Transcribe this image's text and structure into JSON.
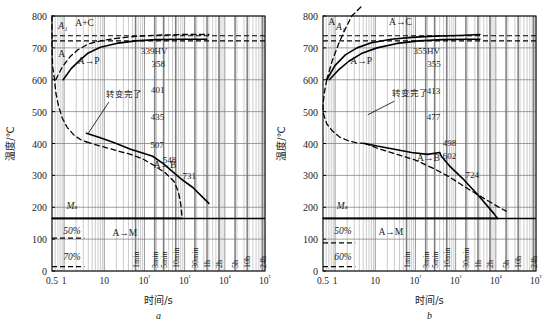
{
  "figure": {
    "title": "",
    "panels": [
      "a",
      "b"
    ]
  },
  "chart_data": [
    {
      "type": "line",
      "panel_label": "a",
      "title": "",
      "xlabel": "时间/s",
      "ylabel": "温度/℃",
      "xscale": "log",
      "xlim": [
        0.5,
        100000
      ],
      "ylim": [
        0,
        800
      ],
      "grid": true,
      "yticks": [
        0,
        100,
        200,
        300,
        400,
        500,
        600,
        700,
        800
      ],
      "xticks": [
        "0.5",
        "1",
        "10",
        "10²",
        "10³",
        "10⁴",
        "10⁵"
      ],
      "xtick_values": [
        0.5,
        1,
        10,
        100,
        1000,
        10000,
        100000
      ],
      "time_markers": [
        {
          "label": "1min",
          "seconds": 60
        },
        {
          "label": "3min",
          "seconds": 180
        },
        {
          "label": "5min",
          "seconds": 300
        },
        {
          "label": "10min",
          "seconds": 600
        },
        {
          "label": "30min",
          "seconds": 1800
        },
        {
          "label": "1h",
          "seconds": 3600
        },
        {
          "label": "2h",
          "seconds": 7200
        },
        {
          "label": "5h",
          "seconds": 18000
        },
        {
          "label": "10h",
          "seconds": 36000
        },
        {
          "label": "24h",
          "seconds": 86400
        }
      ],
      "region_labels": [
        {
          "text": "A₁",
          "x": 0.72,
          "y": 760,
          "italic": true
        },
        {
          "text": "A+C",
          "x": 1.9,
          "y": 770,
          "italic": false
        },
        {
          "text": "A",
          "x": 0.72,
          "y": 672,
          "italic": false
        },
        {
          "text": "A→P",
          "x": 2.2,
          "y": 648,
          "italic": false
        },
        {
          "text": "转变完了",
          "x": 11,
          "y": 545,
          "italic": false
        },
        {
          "text": "A→B",
          "x": 170,
          "y": 323,
          "italic": false
        },
        {
          "text": "Mₛ",
          "x": 1.15,
          "y": 196,
          "italic": true
        },
        {
          "text": "50%",
          "x": 0.95,
          "y": 116,
          "italic": true
        },
        {
          "text": "70%",
          "x": 0.95,
          "y": 36,
          "italic": true
        },
        {
          "text": "A→M",
          "x": 16,
          "y": 110,
          "italic": false
        }
      ],
      "hardness_labels": [
        {
          "text": "339HV",
          "x": 175,
          "y": 680
        },
        {
          "text": "358",
          "x": 220,
          "y": 640
        },
        {
          "text": "401",
          "x": 215,
          "y": 558
        },
        {
          "text": "435",
          "x": 210,
          "y": 475
        },
        {
          "text": "507",
          "x": 205,
          "y": 385
        },
        {
          "text": "548",
          "x": 420,
          "y": 340
        },
        {
          "text": "731",
          "x": 1300,
          "y": 290
        }
      ],
      "horizontal_lines": [
        {
          "name": "A3-dashed",
          "y": 738,
          "style": "dashed"
        },
        {
          "name": "A1-dashed",
          "y": 722,
          "style": "dashed"
        },
        {
          "name": "Ms-solid",
          "y": 165,
          "style": "solid"
        },
        {
          "name": "50pct",
          "y": 103,
          "style": "dashed"
        },
        {
          "name": "70pct",
          "y": 14,
          "style": "dashed"
        }
      ],
      "series": [
        {
          "name": "A-nose-start (dashed)",
          "style": "dashed",
          "points": [
            [
              0.5,
              800
            ],
            [
              0.5,
              700
            ],
            [
              0.52,
              640
            ],
            [
              0.58,
              600
            ],
            [
              0.62,
              560
            ],
            [
              0.72,
              520
            ],
            [
              0.9,
              480
            ],
            [
              1.2,
              450
            ],
            [
              1.8,
              425
            ],
            [
              2.6,
              412
            ],
            [
              3.6,
              405
            ]
          ]
        },
        {
          "name": "transform-start (dashed upper)",
          "style": "dashed",
          "points": [
            [
              0.62,
              600
            ],
            [
              0.9,
              640
            ],
            [
              1.4,
              672
            ],
            [
              2.2,
              694
            ],
            [
              4,
              712
            ],
            [
              8,
              722
            ],
            [
              20,
              730
            ],
            [
              60,
              736
            ],
            [
              200,
              740
            ],
            [
              900,
              742
            ],
            [
              4000,
              742
            ]
          ]
        },
        {
          "name": "transform-finish (solid upper)",
          "style": "solid",
          "points": [
            [
              0.95,
              600
            ],
            [
              1.5,
              635
            ],
            [
              2.4,
              660
            ],
            [
              4,
              684
            ],
            [
              8,
              702
            ],
            [
              20,
              714
            ],
            [
              60,
              722
            ],
            [
              200,
              726
            ],
            [
              900,
              727
            ],
            [
              3500,
              727
            ]
          ]
        },
        {
          "name": "ferrite/pearlite finish (solid)",
          "style": "solid",
          "points": [
            [
              3.6,
              432
            ],
            [
              8,
              418
            ],
            [
              20,
              400
            ],
            [
              45,
              382
            ],
            [
              90,
              370
            ],
            [
              160,
              360
            ],
            [
              300,
              336
            ],
            [
              500,
              312
            ],
            [
              800,
              290
            ],
            [
              1600,
              262
            ],
            [
              4000,
              212
            ]
          ]
        },
        {
          "name": "bainite boundary (dashed lower)",
          "style": "dashed",
          "points": [
            [
              3.6,
              405
            ],
            [
              8,
              392
            ],
            [
              20,
              378
            ],
            [
              45,
              366
            ],
            [
              90,
              352
            ],
            [
              180,
              330
            ],
            [
              330,
              308
            ],
            [
              550,
              280
            ],
            [
              700,
              248
            ],
            [
              800,
              210
            ],
            [
              860,
              170
            ]
          ]
        },
        {
          "name": "Ms end to martensite",
          "style": "solid",
          "points": [
            [
              0.5,
              165
            ],
            [
              860,
              165
            ]
          ]
        }
      ],
      "leader_lines": [
        {
          "name": "transform-finish-leader",
          "from": [
            13,
            530
          ],
          "to": [
            4.0,
            432
          ]
        }
      ]
    },
    {
      "type": "line",
      "panel_label": "b",
      "title": "",
      "xlabel": "时间/s",
      "ylabel": "温度/℃",
      "xscale": "log",
      "xlim": [
        0.5,
        100000
      ],
      "ylim": [
        0,
        800
      ],
      "grid": true,
      "yticks": [
        0,
        100,
        200,
        300,
        400,
        500,
        600,
        700,
        800
      ],
      "xticks": [
        "0.5",
        "1",
        "10",
        "10²",
        "10³",
        "10⁴",
        "10⁵"
      ],
      "xtick_values": [
        0.5,
        1,
        10,
        100,
        1000,
        10000,
        100000
      ],
      "time_markers": [
        {
          "label": "1min",
          "seconds": 60
        },
        {
          "label": "3min",
          "seconds": 180
        },
        {
          "label": "5min",
          "seconds": 300
        },
        {
          "label": "10min",
          "seconds": 600
        },
        {
          "label": "30min",
          "seconds": 1800
        },
        {
          "label": "1h",
          "seconds": 3600
        },
        {
          "label": "2h",
          "seconds": 7200
        },
        {
          "label": "5h",
          "seconds": 18000
        },
        {
          "label": "10h",
          "seconds": 36000
        },
        {
          "label": "24h",
          "seconds": 86400
        }
      ],
      "region_labels": [
        {
          "text": "A",
          "x": 0.68,
          "y": 772,
          "italic": false
        },
        {
          "text": "A₁",
          "x": 1.05,
          "y": 757,
          "italic": true
        },
        {
          "text": "A→C",
          "x": 22,
          "y": 772,
          "italic": false
        },
        {
          "text": "A→P",
          "x": 2.4,
          "y": 648,
          "italic": false
        },
        {
          "text": "转变完了",
          "x": 26,
          "y": 548,
          "italic": false
        },
        {
          "text": "A→B",
          "x": 110,
          "y": 345,
          "italic": false
        },
        {
          "text": "Mₛ",
          "x": 1.1,
          "y": 196,
          "italic": true
        },
        {
          "text": "50%",
          "x": 0.95,
          "y": 116,
          "italic": true
        },
        {
          "text": "60%",
          "x": 0.95,
          "y": 36,
          "italic": true
        },
        {
          "text": "A→M",
          "x": 12,
          "y": 112,
          "italic": false
        }
      ],
      "hardness_labels": [
        {
          "text": "355HV",
          "x": 190,
          "y": 680
        },
        {
          "text": "355",
          "x": 290,
          "y": 640
        },
        {
          "text": "413",
          "x": 280,
          "y": 556
        },
        {
          "text": "477",
          "x": 280,
          "y": 474
        },
        {
          "text": "498",
          "x": 700,
          "y": 392
        },
        {
          "text": "602",
          "x": 700,
          "y": 352
        },
        {
          "text": "724",
          "x": 2600,
          "y": 292
        }
      ],
      "horizontal_lines": [
        {
          "name": "A3-dashed",
          "y": 738,
          "style": "dashed"
        },
        {
          "name": "A1-dashed",
          "y": 722,
          "style": "dashed"
        },
        {
          "name": "Ms-solid",
          "y": 165,
          "style": "solid"
        },
        {
          "name": "50pct",
          "y": 88,
          "style": "dashed"
        },
        {
          "name": "60pct",
          "y": 14,
          "style": "dashed"
        }
      ],
      "series": [
        {
          "name": "A-nose-start (dashed)",
          "style": "dashed",
          "points": [
            [
              0.62,
              600
            ],
            [
              0.54,
              560
            ],
            [
              0.5,
              520
            ],
            [
              0.52,
              490
            ],
            [
              0.62,
              462
            ],
            [
              0.85,
              440
            ],
            [
              1.3,
              420
            ],
            [
              2.2,
              408
            ],
            [
              3.5,
              402
            ],
            [
              5.5,
              400
            ]
          ]
        },
        {
          "name": "A-to-C (dashed, exits top)",
          "style": "dashed",
          "points": [
            [
              0.62,
              600
            ],
            [
              0.85,
              660
            ],
            [
              1.2,
              710
            ],
            [
              1.8,
              760
            ],
            [
              2.6,
              800
            ],
            [
              4.5,
              830
            ]
          ]
        },
        {
          "name": "transform-start (solid upper)",
          "style": "solid",
          "points": [
            [
              0.62,
              600
            ],
            [
              1.0,
              645
            ],
            [
              1.8,
              678
            ],
            [
              3.5,
              700
            ],
            [
              8,
              716
            ],
            [
              25,
              727
            ],
            [
              80,
              733
            ],
            [
              300,
              737
            ],
            [
              1200,
              739
            ],
            [
              4000,
              742
            ]
          ]
        },
        {
          "name": "transform-finish (solid lower-upper)",
          "style": "solid",
          "points": [
            [
              0.72,
              600
            ],
            [
              1.2,
              630
            ],
            [
              2.2,
              658
            ],
            [
              4.5,
              682
            ],
            [
              11,
              700
            ],
            [
              35,
              714
            ],
            [
              120,
              722
            ],
            [
              500,
              726
            ],
            [
              2000,
              727
            ],
            [
              4000,
              727
            ]
          ]
        },
        {
          "name": "pearlite finish (solid)",
          "style": "solid",
          "points": [
            [
              5.5,
              400
            ],
            [
              11,
              392
            ],
            [
              30,
              382
            ],
            [
              80,
              372
            ],
            [
              200,
              366
            ],
            [
              400,
              372
            ],
            [
              440,
              360
            ],
            [
              700,
              330
            ],
            [
              1500,
              290
            ],
            [
              3500,
              240
            ],
            [
              9000,
              180
            ],
            [
              11000,
              165
            ]
          ]
        },
        {
          "name": "bainite boundary (dashed lower)",
          "style": "dashed",
          "points": [
            [
              5.5,
              400
            ],
            [
              12,
              384
            ],
            [
              35,
              366
            ],
            [
              100,
              348
            ],
            [
              300,
              320
            ],
            [
              700,
              295
            ],
            [
              1800,
              262
            ],
            [
              5000,
              228
            ],
            [
              12000,
              200
            ],
            [
              18000,
              188
            ]
          ]
        },
        {
          "name": "Ms to martensite",
          "style": "solid",
          "points": [
            [
              0.5,
              165
            ],
            [
              11000,
              165
            ]
          ]
        }
      ],
      "leader_lines": [
        {
          "name": "transform-finish-leader",
          "from": [
            30,
            533
          ],
          "to": [
            6.5,
            490
          ]
        }
      ]
    }
  ]
}
